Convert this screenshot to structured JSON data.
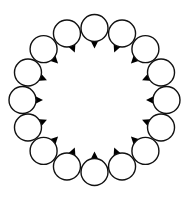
{
  "diagram": {
    "type": "ring-of-circles",
    "canvas": {
      "width": 187,
      "height": 199,
      "background": "#ffffff"
    },
    "ring": {
      "cx": 94.5,
      "cy": 100,
      "radius": 72,
      "count": 16,
      "start_angle_deg": -90
    },
    "circle": {
      "radius": 13.5,
      "stroke": "#111111",
      "stroke_width": 1.4,
      "fill": "#ffffff"
    },
    "tip": {
      "direction": "inward",
      "length": 7,
      "half_width": 5,
      "fill": "#000000"
    }
  }
}
